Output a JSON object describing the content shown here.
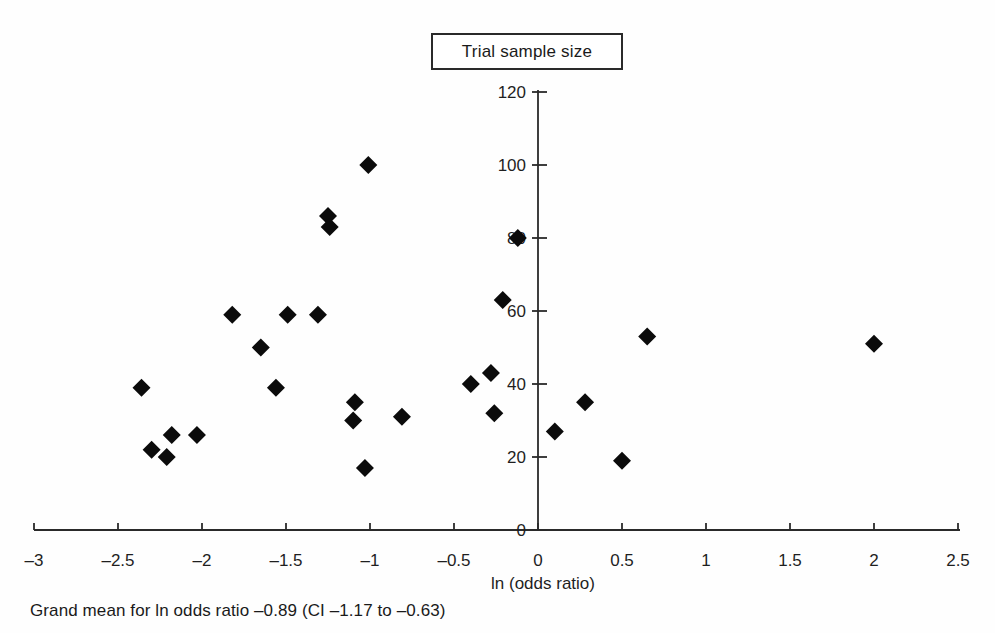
{
  "chart_data": {
    "type": "scatter",
    "title": "Trial sample size",
    "xlabel": "ln (odds ratio)",
    "ylabel": "Trial sample size",
    "xlim": [
      -3,
      2.5
    ],
    "ylim": [
      0,
      120
    ],
    "grid": false,
    "legend_position": "none",
    "marker": "diamond",
    "marker_color": "#0b0b0b",
    "axis_color": "#2a2a2a",
    "text_color": "#1f1f1f",
    "x_ticks": [
      -3,
      -2.5,
      -2,
      -1.5,
      -1,
      -0.5,
      0,
      0.5,
      1,
      1.5,
      2,
      2.5
    ],
    "x_tick_labels": [
      "–3",
      "–2.5",
      "–2",
      "–1.5",
      "–1",
      "–0.5",
      "0",
      "0.5",
      "1",
      "1.5",
      "2",
      "2.5"
    ],
    "y_ticks": [
      0,
      20,
      40,
      60,
      80,
      100,
      120
    ],
    "y_tick_labels": [
      "0",
      "20",
      "40",
      "60",
      "80",
      "100",
      "120"
    ],
    "points": [
      {
        "x": -2.36,
        "y": 39
      },
      {
        "x": -2.3,
        "y": 22
      },
      {
        "x": -2.21,
        "y": 20
      },
      {
        "x": -2.18,
        "y": 26
      },
      {
        "x": -2.03,
        "y": 26
      },
      {
        "x": -1.82,
        "y": 59
      },
      {
        "x": -1.65,
        "y": 50
      },
      {
        "x": -1.56,
        "y": 39
      },
      {
        "x": -1.49,
        "y": 59
      },
      {
        "x": -1.31,
        "y": 59
      },
      {
        "x": -1.25,
        "y": 86
      },
      {
        "x": -1.24,
        "y": 83
      },
      {
        "x": -1.1,
        "y": 30
      },
      {
        "x": -1.09,
        "y": 35
      },
      {
        "x": -1.03,
        "y": 17
      },
      {
        "x": -1.01,
        "y": 100
      },
      {
        "x": -0.81,
        "y": 31
      },
      {
        "x": -0.4,
        "y": 40
      },
      {
        "x": -0.28,
        "y": 43
      },
      {
        "x": -0.26,
        "y": 32
      },
      {
        "x": -0.21,
        "y": 63
      },
      {
        "x": -0.12,
        "y": 80
      },
      {
        "x": 0.1,
        "y": 27
      },
      {
        "x": 0.28,
        "y": 35
      },
      {
        "x": 0.5,
        "y": 19
      },
      {
        "x": 0.65,
        "y": 53
      },
      {
        "x": 2.0,
        "y": 51
      }
    ]
  },
  "note": "Grand mean for ln odds ratio –0.89 (CI –1.17 to –0.63)"
}
